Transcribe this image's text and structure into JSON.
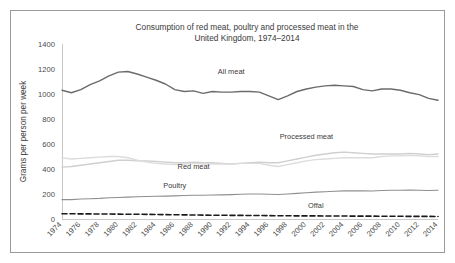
{
  "chart_data": {
    "type": "line",
    "title": "Consumption of red meat, poultry and processed meat in the United Kingdom, 1974–2014",
    "title_line1": "Consumption of red meat, poultry and processed meat in the",
    "title_line2": "United Kingdom, 1974–2014",
    "xlabel": "",
    "ylabel": "Grams per person per week",
    "ylim": [
      0,
      1400
    ],
    "yticks": [
      0,
      200,
      400,
      600,
      800,
      1000,
      1200,
      1400
    ],
    "ytick_labels": [
      "0",
      "200",
      "400",
      "600",
      "800",
      "1000",
      "1200",
      "1400"
    ],
    "xlim": [
      1974,
      2014
    ],
    "xticks": [
      1974,
      1976,
      1978,
      1980,
      1982,
      1984,
      1986,
      1988,
      1990,
      1992,
      1994,
      1996,
      1998,
      2000,
      2002,
      2004,
      2006,
      2008,
      2010,
      2012,
      2014
    ],
    "xtick_labels": [
      "1974",
      "1976",
      "1978",
      "1980",
      "1982",
      "1984",
      "1986",
      "1988",
      "1990",
      "1992",
      "1994",
      "1996",
      "1998",
      "2000",
      "2002",
      "2004",
      "2006",
      "2008",
      "2010",
      "2012",
      "2014"
    ],
    "xtick_rotation": 45,
    "grid": false,
    "legend_position": "inline-annotations",
    "x": [
      1974,
      1975,
      1976,
      1977,
      1978,
      1979,
      1980,
      1981,
      1982,
      1983,
      1984,
      1985,
      1986,
      1987,
      1988,
      1989,
      1990,
      1991,
      1992,
      1993,
      1994,
      1995,
      1996,
      1997,
      1998,
      1999,
      2000,
      2001,
      2002,
      2003,
      2004,
      2005,
      2006,
      2007,
      2008,
      2009,
      2010,
      2011,
      2012,
      2013,
      2014
    ],
    "series": [
      {
        "name": "All meat",
        "color": "#6b6b6b",
        "style": "solid",
        "width": 1.4,
        "label_x": 1992,
        "label_y": 1160,
        "values": [
          1030,
          1010,
          1035,
          1075,
          1105,
          1145,
          1175,
          1180,
          1160,
          1135,
          1110,
          1080,
          1035,
          1020,
          1025,
          1005,
          1020,
          1015,
          1015,
          1020,
          1020,
          1015,
          985,
          955,
          985,
          1020,
          1040,
          1055,
          1065,
          1070,
          1065,
          1060,
          1035,
          1025,
          1040,
          1040,
          1030,
          1010,
          995,
          965,
          950
        ]
      },
      {
        "name": "Processed meat",
        "color": "#cfcfcf",
        "style": "solid",
        "width": 1.3,
        "label_x": 2000,
        "label_y": 640,
        "values": [
          415,
          420,
          430,
          440,
          450,
          460,
          470,
          470,
          465,
          465,
          460,
          455,
          450,
          450,
          455,
          450,
          450,
          445,
          440,
          445,
          450,
          455,
          450,
          450,
          465,
          480,
          495,
          510,
          520,
          530,
          535,
          530,
          525,
          520,
          520,
          520,
          520,
          525,
          520,
          515,
          520
        ]
      },
      {
        "name": "Red meat",
        "color": "#dcdcdc",
        "style": "solid",
        "width": 1.3,
        "label_x": 1988,
        "label_y": 400,
        "values": [
          490,
          480,
          485,
          490,
          495,
          500,
          500,
          490,
          470,
          455,
          445,
          440,
          435,
          440,
          445,
          440,
          440,
          440,
          440,
          445,
          445,
          445,
          430,
          420,
          435,
          450,
          465,
          475,
          480,
          485,
          490,
          490,
          490,
          490,
          500,
          505,
          505,
          510,
          505,
          500,
          500
        ]
      },
      {
        "name": "Poultry",
        "color": "#8f8f8f",
        "style": "solid",
        "width": 1.2,
        "label_x": 1986,
        "label_y": 250,
        "values": [
          155,
          155,
          160,
          162,
          165,
          170,
          172,
          175,
          178,
          180,
          182,
          183,
          185,
          188,
          190,
          190,
          192,
          193,
          195,
          198,
          200,
          200,
          198,
          196,
          200,
          205,
          210,
          215,
          218,
          222,
          225,
          226,
          225,
          224,
          228,
          230,
          230,
          232,
          230,
          228,
          230
        ]
      },
      {
        "name": "Offal",
        "color": "#1a1a1a",
        "style": "dashed",
        "width": 1.6,
        "label_x": 2001,
        "label_y": 92,
        "values": [
          42,
          42,
          41,
          41,
          40,
          40,
          39,
          38,
          38,
          37,
          36,
          35,
          34,
          33,
          32,
          31,
          30,
          30,
          29,
          29,
          28,
          28,
          27,
          26,
          26,
          25,
          25,
          25,
          24,
          24,
          24,
          23,
          23,
          23,
          22,
          22,
          22,
          21,
          21,
          21,
          20
        ]
      }
    ]
  }
}
